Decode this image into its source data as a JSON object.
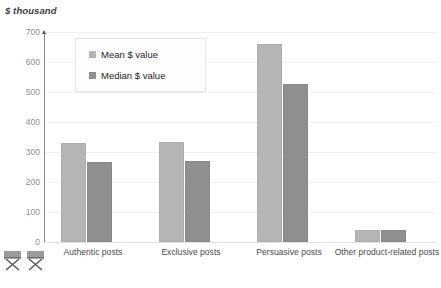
{
  "chart_data": {
    "type": "bar",
    "title": "",
    "subtitle": "",
    "ylabel": "$ thousand",
    "xlabel": "",
    "ylim": [
      0,
      700
    ],
    "yticks": [
      0,
      100,
      200,
      300,
      400,
      500,
      600,
      700
    ],
    "ytick_labels": [
      "0",
      "100",
      "200",
      "300",
      "400",
      "500",
      "600",
      "700"
    ],
    "grid": true,
    "legend_position": "upper-left-inside",
    "categories": [
      "Authentic posts",
      "Exclusive posts",
      "Persuasive posts",
      "Other product-related posts"
    ],
    "series": [
      {
        "name": "Mean $ value",
        "color": "#b5b5b5",
        "values": [
          325,
          328,
          655,
          35
        ]
      },
      {
        "name": "Median $ value",
        "color": "#8f8f8f",
        "values": [
          260,
          263,
          520,
          33
        ]
      }
    ]
  },
  "axis": {
    "y_title": "$ thousand"
  },
  "legend": {
    "items": [
      {
        "label": "Mean $ value",
        "swatch": "mean"
      },
      {
        "label": "Median $ value",
        "swatch": "median"
      }
    ]
  },
  "decorations": {
    "placeholder_icons": [
      "broken-image-icon",
      "broken-image-icon"
    ]
  },
  "colors": {
    "mean": "#b5b5b5",
    "median": "#8f8f8f",
    "gridline": "#f0f0f0",
    "axis": "#8a8a8a",
    "tick_text": "#8f8f8f",
    "label_text": "#4a4a4a"
  }
}
